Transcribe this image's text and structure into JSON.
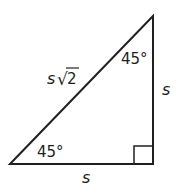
{
  "diagram": {
    "labels": {
      "hypotenuse_prefix": "s",
      "hypotenuse_radical": "√",
      "hypotenuse_radicand": "2",
      "top_angle": "45°",
      "bottom_angle": "45°",
      "vertical_side": "s",
      "horizontal_side": "s"
    },
    "colors": {
      "stroke": "#231f20",
      "background": "#ffffff"
    }
  }
}
